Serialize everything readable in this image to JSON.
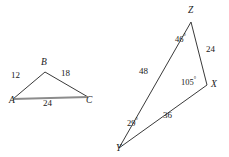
{
  "figure": {
    "stroke_color": "#3a3a3a",
    "highlight_color": "#8c8c8c",
    "text_color": "#1a1a1a",
    "background": "#ffffff"
  },
  "triangle_abc": {
    "name": "triangle-abc",
    "vertices": [
      {
        "id": "A",
        "label": "A",
        "x": 13,
        "y": 99
      },
      {
        "id": "B",
        "label": "B",
        "x": 45,
        "y": 72
      },
      {
        "id": "C",
        "label": "C",
        "x": 88,
        "y": 97
      }
    ],
    "vertex_labels": [
      {
        "label": "A",
        "x": 9,
        "y": 101
      },
      {
        "label": "B",
        "x": 41,
        "y": 59
      },
      {
        "label": "C",
        "x": 86,
        "y": 101
      }
    ],
    "sides": [
      {
        "from": "A",
        "to": "B",
        "label": "12",
        "x": 11,
        "y": 72
      },
      {
        "from": "B",
        "to": "C",
        "label": "18",
        "x": 61,
        "y": 70
      },
      {
        "from": "A",
        "to": "C",
        "label": "24",
        "x": 43,
        "y": 100,
        "highlighted": true
      }
    ]
  },
  "triangle_xyz": {
    "name": "triangle-xyz",
    "vertices": [
      {
        "id": "Z",
        "label": "Z",
        "x": 191,
        "y": 22
      },
      {
        "id": "X",
        "label": "X",
        "x": 207,
        "y": 85
      },
      {
        "id": "Y",
        "label": "Y",
        "x": 119,
        "y": 148
      }
    ],
    "vertex_labels": [
      {
        "label": "Z",
        "x": 188,
        "y": 8
      },
      {
        "label": "X",
        "x": 211,
        "y": 82
      },
      {
        "label": "Y",
        "x": 116,
        "y": 146
      }
    ],
    "sides": [
      {
        "from": "Z",
        "to": "X",
        "label": "24",
        "x": 206,
        "y": 46
      },
      {
        "from": "X",
        "to": "Y",
        "label": "36",
        "x": 163,
        "y": 112
      },
      {
        "from": "Y",
        "to": "Z",
        "label": "48",
        "x": 139,
        "y": 68
      }
    ],
    "angles": [
      {
        "at": "Z",
        "value": "46",
        "unit": "°",
        "x": 175,
        "y": 35
      },
      {
        "at": "X",
        "value": "105",
        "unit": "°",
        "x": 181,
        "y": 78
      },
      {
        "at": "Y",
        "value": "29",
        "unit": "°",
        "x": 127,
        "y": 119
      }
    ]
  }
}
